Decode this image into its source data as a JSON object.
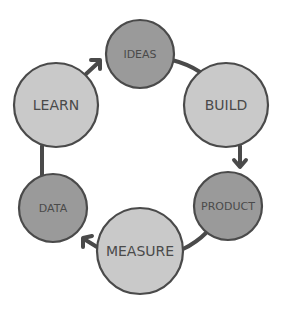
{
  "diagram": {
    "type": "cycle",
    "colors": {
      "dark_fill": "#9a9a9a",
      "light_fill": "#c9c9c9",
      "stroke": "#4a4a4a",
      "text": "#4a4a4a",
      "background": "#ffffff"
    },
    "nodes": [
      {
        "id": "ideas",
        "label": "IDEAS",
        "cx": 140,
        "cy": 54,
        "r": 34,
        "shade": "dark",
        "font_size": 11
      },
      {
        "id": "build",
        "label": "BUILD",
        "cx": 226,
        "cy": 105,
        "r": 42,
        "shade": "light",
        "font_size": 14
      },
      {
        "id": "product",
        "label": "PRODUCT",
        "cx": 228,
        "cy": 206,
        "r": 34,
        "shade": "dark",
        "font_size": 11
      },
      {
        "id": "measure",
        "label": "MEASURE",
        "cx": 140,
        "cy": 251,
        "r": 43,
        "shade": "light",
        "font_size": 14
      },
      {
        "id": "data",
        "label": "DATA",
        "cx": 53,
        "cy": 208,
        "r": 34,
        "shade": "dark",
        "font_size": 11
      },
      {
        "id": "learn",
        "label": "LEARN",
        "cx": 56,
        "cy": 105,
        "r": 42,
        "shade": "light",
        "font_size": 14
      }
    ],
    "edges": [
      {
        "from": "ideas",
        "to": "build",
        "arrow": false
      },
      {
        "from": "build",
        "to": "product",
        "arrow": true
      },
      {
        "from": "product",
        "to": "measure",
        "arrow": false
      },
      {
        "from": "measure",
        "to": "data",
        "arrow": true
      },
      {
        "from": "data",
        "to": "learn",
        "arrow": false
      },
      {
        "from": "learn",
        "to": "ideas",
        "arrow": true
      }
    ]
  }
}
